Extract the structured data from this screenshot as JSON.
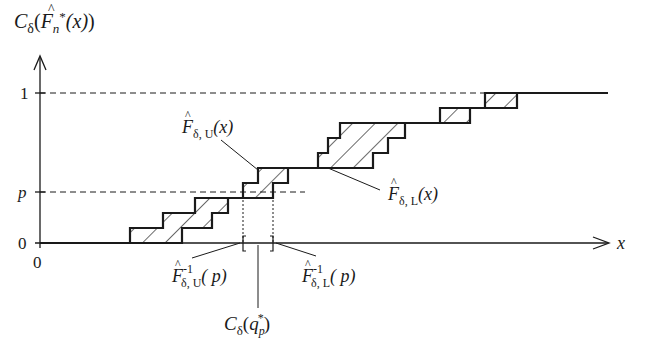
{
  "diagram": {
    "y_axis_label": {
      "C": "C",
      "delta": "δ",
      "F": "F",
      "n": "n",
      "star": "*",
      "arg": "(x)"
    },
    "x_axis_label": "x",
    "origin_label": "0",
    "y_ticks": [
      {
        "label": "1",
        "level": 1
      },
      {
        "label": "p",
        "level": "p"
      },
      {
        "label": "0",
        "level": 0
      }
    ],
    "annotations": {
      "upper_curve": {
        "F": "F",
        "sub": "δ, U",
        "arg": "(x)"
      },
      "lower_curve": {
        "F": "F",
        "sub": "δ, L",
        "arg": "(x)"
      },
      "upper_inverse": {
        "F": "F",
        "sup": "-1",
        "sub": "δ, U",
        "arg": "( p)"
      },
      "lower_inverse": {
        "F": "F",
        "sup": "-1",
        "sub": "δ, L",
        "arg": "( p)"
      },
      "quantile_interval": {
        "C": "C",
        "delta": "δ",
        "q": "q",
        "sub": "p",
        "star": "*",
        "open": "(",
        "close": ")"
      }
    },
    "colors": {
      "ink": "#1a1a1a",
      "background": "#ffffff"
    }
  }
}
